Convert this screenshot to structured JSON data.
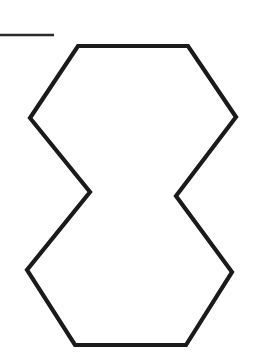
{
  "page": {
    "background_color": "#ffffff",
    "width": 271,
    "height": 356
  },
  "figure": {
    "name": "hexagonal-hourglass-outline",
    "stroke_color": "#1a1a1a",
    "stroke_width": 4.2,
    "fill": "none",
    "points": "78,46 188,46 236,117 176,196 232,272 186,345 75,345 27,270 90,192 30,118",
    "vertices": [
      {
        "label": "top-left",
        "x": 78,
        "y": 46
      },
      {
        "label": "top-right",
        "x": 188,
        "y": 46
      },
      {
        "label": "upper-right",
        "x": 236,
        "y": 117
      },
      {
        "label": "waist-right",
        "x": 176,
        "y": 196
      },
      {
        "label": "lower-right",
        "x": 232,
        "y": 272
      },
      {
        "label": "bottom-right",
        "x": 186,
        "y": 345
      },
      {
        "label": "bottom-left",
        "x": 75,
        "y": 345
      },
      {
        "label": "lower-left",
        "x": 27,
        "y": 270
      },
      {
        "label": "waist-left",
        "x": 90,
        "y": 192
      },
      {
        "label": "upper-left",
        "x": 30,
        "y": 118
      }
    ]
  },
  "rule_mark": {
    "name": "horizontal-rule-segment",
    "stroke_color": "#2b2b2b",
    "stroke_width": 2.6,
    "x1": 0,
    "y1": 35,
    "x2": 54,
    "y2": 35
  }
}
